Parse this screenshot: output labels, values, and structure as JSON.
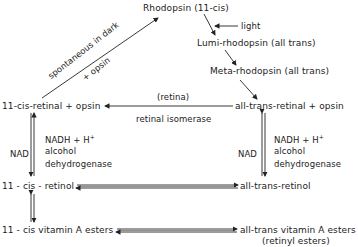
{
  "diagram": {
    "type": "visual cycle pathway",
    "nodes": {
      "rhodopsin": "Rhodopsin (11-cis)",
      "lumi": "Lumi-rhodopsin (all trans)",
      "meta": "Meta-rhodopsin (all trans)",
      "cis_retinal_opsin": "11-cis-retinal + opsin",
      "trans_retinal_opsin": "all-trans-retinal + opsin",
      "cis_retinol": "11 - cis - retinol",
      "trans_retinol": "all-trans-retinol",
      "cis_esters": "11 - cis  vitamin A esters",
      "trans_esters": "all-trans vitamin A esters",
      "trans_esters_sub": "(retinyl esters)"
    },
    "labels": {
      "light": "light",
      "spontaneous": "spontaneous in dark",
      "plus_opsin": "+ opsin",
      "retina": "(retina)",
      "isomerase": "retinal isomerase",
      "nad_left": "NAD",
      "nadh_left": "NADH + H",
      "nadh_sup": "+",
      "adh_left_1": "alcohol",
      "adh_left_2": "dehydrogenase",
      "nad_right": "NAD",
      "nadh_right": "NADH + H",
      "adh_right_1": "alcohol",
      "adh_right_2": "dehydrogenase"
    },
    "edges": [
      {
        "from": "rhodopsin",
        "to": "lumi",
        "label": "light"
      },
      {
        "from": "lumi",
        "to": "meta"
      },
      {
        "from": "meta",
        "to": "trans_retinal_opsin"
      },
      {
        "from": "trans_retinal_opsin",
        "to": "cis_retinal_opsin",
        "label": "(retina) retinal isomerase"
      },
      {
        "from": "cis_retinal_opsin",
        "to": "rhodopsin",
        "label": "spontaneous in dark + opsin"
      },
      {
        "from": "cis_retinal_opsin",
        "to": "cis_retinol",
        "bidirectional": true,
        "label": "NAD / NADH + H+ alcohol dehydrogenase"
      },
      {
        "from": "trans_retinal_opsin",
        "to": "trans_retinol",
        "bidirectional": true,
        "label": "NAD / NADH + H+ alcohol dehydrogenase"
      },
      {
        "from": "cis_retinol",
        "to": "trans_retinol",
        "bidirectional": true
      },
      {
        "from": "cis_retinol",
        "to": "cis_esters",
        "bidirectional": true
      },
      {
        "from": "cis_esters",
        "to": "trans_esters",
        "bidirectional": true
      }
    ]
  }
}
